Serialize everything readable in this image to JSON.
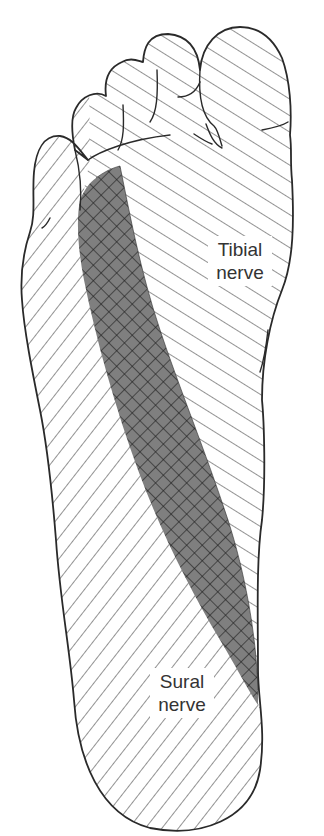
{
  "figure": {
    "regions": [
      {
        "id": "tibial",
        "label_line1": "Tibial",
        "label_line2": "nerve",
        "pattern": "diagonal-hatch-descending",
        "description": "Medial sole and toes"
      },
      {
        "id": "sural",
        "label_line1": "Sural",
        "label_line2": "nerve",
        "pattern": "diagonal-hatch-ascending",
        "description": "Lateral sole, heel and little toe"
      },
      {
        "id": "overlap",
        "label_line1": "",
        "label_line2": "",
        "pattern": "cross-hatch-dark",
        "description": "Overlap zone of tibial and sural innervation"
      }
    ],
    "colors": {
      "outline": "#2a2a2a",
      "hatch": "#3a3a3a",
      "overlap_fill": "#7f7f7f",
      "background": "#ffffff",
      "label_text": "#333333"
    }
  }
}
